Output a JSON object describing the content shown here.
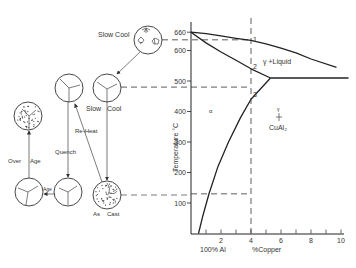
{
  "diagram": {
    "y_axis": {
      "label": "Temperature °C",
      "ticks": [
        "660",
        "600",
        "500",
        "400",
        "300",
        "200",
        "100"
      ],
      "tick_values": [
        660,
        600,
        500,
        400,
        300,
        200,
        100
      ],
      "range": [
        0,
        680
      ]
    },
    "x_axis": {
      "label": "%Copper",
      "origin_label": "100% Al",
      "ticks": [
        "2",
        "4",
        "6",
        "8",
        "10"
      ],
      "tick_values": [
        2,
        4,
        6,
        8,
        10
      ],
      "range": [
        0,
        10.5
      ]
    },
    "regions": {
      "liquid_two_phase": "γ +Liquid",
      "alpha": "α",
      "compound_symbol": "γ",
      "compound": "CuAl₂"
    },
    "points": [
      {
        "label": "1",
        "cu": 4,
        "temp": 635
      },
      {
        "label": "2",
        "cu": 4,
        "temp": 545
      },
      {
        "label": "3",
        "cu": 4,
        "temp": 455
      }
    ],
    "guides": {
      "composition": 4,
      "temps": [
        635,
        480,
        130
      ]
    },
    "curves": {
      "liquidus": [
        [
          0,
          660
        ],
        [
          1,
          655
        ],
        [
          2,
          648
        ],
        [
          3,
          640
        ],
        [
          4,
          633
        ],
        [
          5,
          622
        ],
        [
          6,
          608
        ],
        [
          7,
          592
        ],
        [
          8,
          572
        ],
        [
          9.7,
          545
        ]
      ],
      "solidus": [
        [
          0,
          660
        ],
        [
          1,
          625
        ],
        [
          2,
          595
        ],
        [
          3,
          568
        ],
        [
          4,
          540
        ],
        [
          5.3,
          510
        ]
      ],
      "eutectic": [
        [
          5.3,
          510
        ],
        [
          10.5,
          510
        ]
      ],
      "solvus": [
        [
          0.5,
          0
        ],
        [
          0.8,
          60
        ],
        [
          1.2,
          130
        ],
        [
          1.8,
          220
        ],
        [
          2.5,
          300
        ],
        [
          3.3,
          380
        ],
        [
          4,
          440
        ],
        [
          5.3,
          510
        ]
      ]
    },
    "microstructures": [
      {
        "id": "slow-cool-liquid",
        "label": "Slow Cool",
        "type": "dendrites"
      },
      {
        "id": "slow-cool-solid",
        "label": "Slow Cool",
        "type": "grains"
      },
      {
        "id": "reheated",
        "label": "",
        "type": "grains"
      },
      {
        "id": "over-aged",
        "label": "",
        "type": "dotted"
      },
      {
        "id": "aged",
        "label": "",
        "type": "grains"
      },
      {
        "id": "quenched",
        "label": "",
        "type": "grains"
      },
      {
        "id": "as-cast",
        "label": "As Cast",
        "type": "dotted"
      }
    ],
    "process_labels": {
      "slow_cool_top": "Slow Cool",
      "slow_cool_mid_a": "Slow",
      "slow_cool_mid_b": "Cool",
      "reheat": "Re-Heat",
      "quench": "Quench",
      "over_age_a": "Over",
      "over_age_b": "Age",
      "age": "Age",
      "as_cast_a": "As",
      "as_cast_b": "Cast"
    }
  }
}
